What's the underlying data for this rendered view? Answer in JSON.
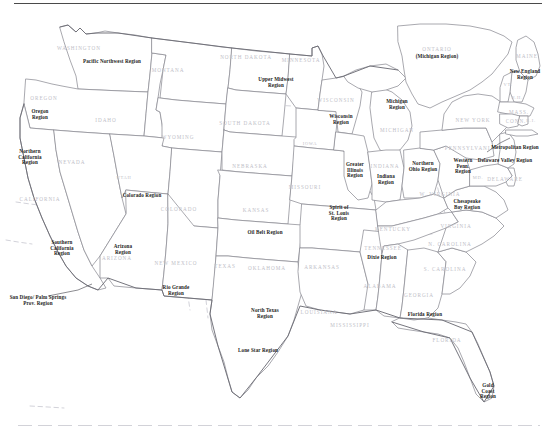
{
  "map": {
    "title": "United States Regions Map",
    "kind": "choropleth-outline",
    "top_rule": true,
    "bottom_rule": true,
    "colors": {
      "background": "#ffffff",
      "state_border": "#8c8c94",
      "nation_border": "#6e6e76",
      "region_divider": "#c3c3cc",
      "state_label": "#c0c0c8",
      "region_label": "#1d1d22",
      "rule": "#4a4a4a"
    },
    "state_labels": [
      {
        "text": "WASHINGTON",
        "x": 79,
        "y": 49
      },
      {
        "text": "OREGON",
        "x": 44,
        "y": 99
      },
      {
        "text": "IDAHO",
        "x": 106,
        "y": 121
      },
      {
        "text": "MONTANA",
        "x": 168,
        "y": 71
      },
      {
        "text": "NEVADA",
        "x": 72,
        "y": 163
      },
      {
        "text": "CALIFORNIA",
        "x": 40,
        "y": 200
      },
      {
        "text": "UTAH",
        "x": 124,
        "y": 178
      },
      {
        "text": "WYOMING",
        "x": 178,
        "y": 138
      },
      {
        "text": "COLORADO",
        "x": 179,
        "y": 210
      },
      {
        "text": "ARIZONA",
        "x": 117,
        "y": 259
      },
      {
        "text": "NEW MEXICO",
        "x": 176,
        "y": 264
      },
      {
        "text": "NORTH DAKOTA",
        "x": 246,
        "y": 58
      },
      {
        "text": "SOUTH DAKOTA",
        "x": 245,
        "y": 124
      },
      {
        "text": "NEBRASKA",
        "x": 250,
        "y": 167
      },
      {
        "text": "KANSAS",
        "x": 256,
        "y": 211
      },
      {
        "text": "OKLAHOMA",
        "x": 267,
        "y": 269
      },
      {
        "text": "TEXAS",
        "x": 225,
        "y": 267
      },
      {
        "text": "MINNESOTA",
        "x": 301,
        "y": 61
      },
      {
        "text": "IOWA",
        "x": 310,
        "y": 144
      },
      {
        "text": "MISSOURI",
        "x": 305,
        "y": 188
      },
      {
        "text": "ARKANSAS",
        "x": 322,
        "y": 268
      },
      {
        "text": "LOUISIANA",
        "x": 319,
        "y": 313
      },
      {
        "text": "MISSISSIPPI",
        "x": 350,
        "y": 326
      },
      {
        "text": "WISCONSIN",
        "x": 336,
        "y": 101
      },
      {
        "text": "MICHIGAN",
        "x": 397,
        "y": 131
      },
      {
        "text": "INDIANA",
        "x": 385,
        "y": 167
      },
      {
        "text": "KENTUCKY",
        "x": 393,
        "y": 230
      },
      {
        "text": "TENNESSEE",
        "x": 383,
        "y": 249
      },
      {
        "text": "ALABAMA",
        "x": 380,
        "y": 287
      },
      {
        "text": "GEORGIA",
        "x": 419,
        "y": 296
      },
      {
        "text": "FLORIDA",
        "x": 447,
        "y": 341
      },
      {
        "text": "N. CAROLINA",
        "x": 450,
        "y": 245
      },
      {
        "text": "S. CAROLINA",
        "x": 445,
        "y": 270
      },
      {
        "text": "VIRGINIA",
        "x": 456,
        "y": 227
      },
      {
        "text": "W. VIRGINIA",
        "x": 440,
        "y": 195
      },
      {
        "text": "NEW YORK",
        "x": 473,
        "y": 121
      },
      {
        "text": "PENNSYLVANIA",
        "x": 470,
        "y": 149
      },
      {
        "text": "MD.",
        "x": 478,
        "y": 178
      },
      {
        "text": "DELAWARE",
        "x": 505,
        "y": 180
      },
      {
        "text": "MAINE",
        "x": 527,
        "y": 57
      },
      {
        "text": "VT.",
        "x": 508,
        "y": 85
      },
      {
        "text": "N.H.",
        "x": 517,
        "y": 98
      },
      {
        "text": "MASS.",
        "x": 519,
        "y": 113
      },
      {
        "text": "CONN.",
        "x": 516,
        "y": 122
      },
      {
        "text": "R.I.",
        "x": 531,
        "y": 121
      },
      {
        "text": "ONTARIO",
        "x": 437,
        "y": 50
      }
    ],
    "region_labels": [
      {
        "text": "Pacific Northwest Region",
        "x": 112,
        "y": 62
      },
      {
        "text": "Oregon\nRegion",
        "x": 40,
        "y": 115
      },
      {
        "text": "Northern\nCalifornia\nRegion",
        "x": 30,
        "y": 158
      },
      {
        "text": "Southern\nCalifornia\nRegion",
        "x": 62,
        "y": 249
      },
      {
        "text": "San Diego/ Palm Springs\nProv. Region",
        "x": 38,
        "y": 301
      },
      {
        "text": "Arizona\nRegion",
        "x": 123,
        "y": 250
      },
      {
        "text": "Rio Grande\nRegion",
        "x": 176,
        "y": 291
      },
      {
        "text": "Colorado Region",
        "x": 142,
        "y": 196
      },
      {
        "text": "Upper Midwest\nRegion",
        "x": 276,
        "y": 83
      },
      {
        "text": "Oil Belt Region",
        "x": 265,
        "y": 233
      },
      {
        "text": "North Texas\nRegion",
        "x": 265,
        "y": 314
      },
      {
        "text": "Lone Star Region",
        "x": 258,
        "y": 351
      },
      {
        "text": "Wisconsin\nRegion",
        "x": 341,
        "y": 120
      },
      {
        "text": "Greater\nIllinois\nRegion",
        "x": 355,
        "y": 171
      },
      {
        "text": "Indiana\nRegion",
        "x": 386,
        "y": 180
      },
      {
        "text": "Spirit of\nSt. Louis\nRegion",
        "x": 339,
        "y": 214
      },
      {
        "text": "Dixie Region",
        "x": 382,
        "y": 258
      },
      {
        "text": "Michigan\nRegion",
        "x": 397,
        "y": 105
      },
      {
        "text": "Northern\nOhio Region",
        "x": 423,
        "y": 167
      },
      {
        "text": "(Michigan Region)",
        "x": 437,
        "y": 57
      },
      {
        "text": "Western\nPenn.\nRegion",
        "x": 463,
        "y": 167
      },
      {
        "text": "Delaware Valley Region",
        "x": 505,
        "y": 161
      },
      {
        "text": "Chesapeake\nBay Region",
        "x": 467,
        "y": 205
      },
      {
        "text": "Metropolitan Region",
        "x": 515,
        "y": 148
      },
      {
        "text": "New England\nRegion",
        "x": 525,
        "y": 75
      },
      {
        "text": "Florida Region",
        "x": 425,
        "y": 315
      },
      {
        "text": "Gold\nCoast\nRegion",
        "x": 488,
        "y": 392
      }
    ]
  }
}
